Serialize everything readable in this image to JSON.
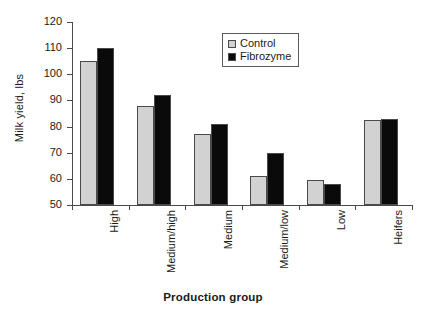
{
  "chart_data": {
    "type": "bar",
    "title": "",
    "xlabel": "Production group",
    "ylabel": "Milk yield, lbs",
    "ylim": [
      50,
      120
    ],
    "yticks": [
      50,
      60,
      70,
      80,
      90,
      100,
      110,
      120
    ],
    "grid": false,
    "legend_position": "top-center",
    "categories": [
      "High",
      "Medium/high",
      "Medium",
      "Medium/low",
      "Low",
      "Heifers"
    ],
    "series": [
      {
        "name": "Control",
        "color": "#d2d2d2",
        "values": [
          105,
          88,
          77,
          61,
          59.5,
          82.5
        ]
      },
      {
        "name": "Fibrozyme",
        "color": "#0a0a0a",
        "values": [
          110,
          92,
          81,
          70,
          58,
          83
        ]
      }
    ]
  }
}
